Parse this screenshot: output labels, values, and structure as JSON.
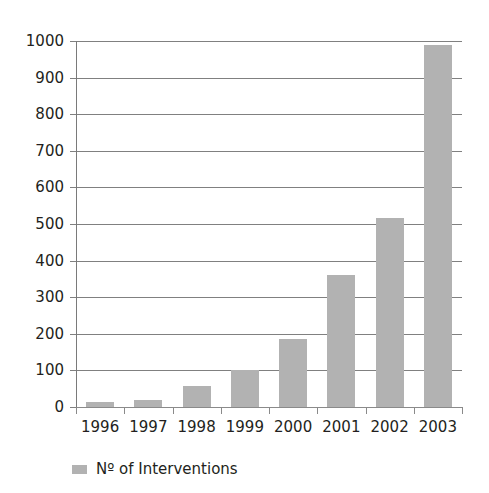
{
  "chart_data": {
    "type": "bar",
    "title": "",
    "subtitle": "",
    "xlabel": "",
    "ylabel": "",
    "categories": [
      "1996",
      "1997",
      "1998",
      "1999",
      "2000",
      "2001",
      "2002",
      "2003"
    ],
    "series": [
      {
        "name": "Nº of Interventions",
        "values": [
          14,
          19,
          57,
          102,
          185,
          360,
          516,
          990
        ],
        "color": "#b2b2b2"
      }
    ],
    "ylim": [
      0,
      1000
    ],
    "y_ticks": [
      0,
      100,
      200,
      300,
      400,
      500,
      600,
      700,
      800,
      900,
      1000
    ],
    "y_tick_labels": [
      "0",
      "100",
      "200",
      "300",
      "400",
      "500",
      "600",
      "700",
      "800",
      "900",
      "1000"
    ],
    "grid": true,
    "grid_axis": "y",
    "legend": {
      "position": "bottom-left",
      "entries": [
        {
          "label": "Nº of Interventions",
          "swatch_color": "#b2b2b2",
          "marker": "square-swatch"
        }
      ]
    },
    "axis_color": "#808080",
    "text_color": "#231f20",
    "background": "#ffffff"
  }
}
